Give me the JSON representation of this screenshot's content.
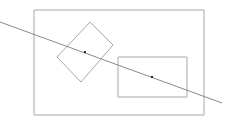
{
  "canvas": {
    "width": 230,
    "height": 127,
    "background": "#ffffff"
  },
  "style": {
    "shape_stroke": "#a8a8a8",
    "line_stroke": "#8a8a8a",
    "point_fill": "#2b2b2b",
    "stroke_width": 1,
    "point_size": 2
  },
  "shapes": {
    "outer_rectangle": {
      "label": "outer boundary rectangle",
      "x": 34,
      "y": 10,
      "width": 170,
      "height": 105,
      "points": "34,10 204,10 204,115 34,115"
    },
    "inner_rectangle": {
      "label": "inner axis-aligned rectangle",
      "x": 118,
      "y": 57,
      "width": 69,
      "height": 40,
      "points": "118,57 187,57 187,97 118,97"
    },
    "rotated_rectangle": {
      "label": "rotated rectangle",
      "points": "90,22 113,45 81,82 57,57"
    }
  },
  "line": {
    "label": "diagonal line",
    "x1": 0,
    "y1": 22,
    "x2": 222,
    "y2": 103
  },
  "points": [
    {
      "label": "center point of rotated rectangle",
      "cx": 85,
      "cy": 52
    },
    {
      "label": "center point of inner rectangle",
      "cx": 152,
      "cy": 77
    }
  ]
}
